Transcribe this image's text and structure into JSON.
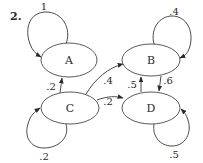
{
  "problem_number": "2.",
  "colors": {
    "stroke": "#4a4a4a",
    "text": "#2a2a2a",
    "background": "#ffffff"
  },
  "nodes": [
    {
      "id": "A",
      "label": "A"
    },
    {
      "id": "B",
      "label": "B"
    },
    {
      "id": "C",
      "label": "C"
    },
    {
      "id": "D",
      "label": "D"
    }
  ],
  "edges": [
    {
      "from": "A",
      "to": "A",
      "label": "1"
    },
    {
      "from": "B",
      "to": "B",
      "label": ".4"
    },
    {
      "from": "C",
      "to": "C",
      "label": ".2"
    },
    {
      "from": "D",
      "to": "D",
      "label": ".5"
    },
    {
      "from": "C",
      "to": "A",
      "label": ".2"
    },
    {
      "from": "C",
      "to": "B",
      "label": ".4"
    },
    {
      "from": "C",
      "to": "D",
      "label": ".2"
    },
    {
      "from": "D",
      "to": "B",
      "label": ".5"
    },
    {
      "from": "B",
      "to": "D",
      "label": ".6"
    }
  ]
}
